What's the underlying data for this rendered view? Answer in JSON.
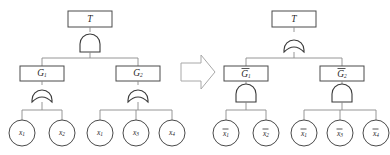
{
  "figure": {
    "background_color": "#ffffff",
    "wire_color": "#8a8a8a",
    "gate_stroke_color": "#3a3a3a",
    "box_stroke_color": "#4a4a4a",
    "arrow_stroke_color": "#a8a8a8",
    "text_color": "#2a2a2a"
  },
  "transform_arrow": {
    "name": "block-arrow-right",
    "direction": "right",
    "label": ""
  },
  "trees": [
    {
      "id": "left-tree",
      "name": "original-fault-tree",
      "root": {
        "label": "T",
        "overbar": false,
        "shape": "rectangle"
      },
      "root_gate": {
        "type": "AND",
        "name": "and-gate-top"
      },
      "intermediates": [
        {
          "label": "G",
          "subscript": "1",
          "overbar": false,
          "shape": "rectangle",
          "gate": {
            "type": "OR",
            "name": "or-gate-g1"
          },
          "leaves": [
            {
              "label": "x",
              "subscript": "1",
              "overbar": false
            },
            {
              "label": "x",
              "subscript": "2",
              "overbar": false
            }
          ]
        },
        {
          "label": "G",
          "subscript": "2",
          "overbar": false,
          "shape": "rectangle",
          "gate": {
            "type": "OR",
            "name": "or-gate-g2"
          },
          "leaves": [
            {
              "label": "x",
              "subscript": "1",
              "overbar": false
            },
            {
              "label": "x",
              "subscript": "3",
              "overbar": false
            },
            {
              "label": "x",
              "subscript": "4",
              "overbar": false
            }
          ]
        }
      ]
    },
    {
      "id": "right-tree",
      "name": "dual-fault-tree",
      "root": {
        "label": "T",
        "overbar": false,
        "shape": "rectangle"
      },
      "root_gate": {
        "type": "OR",
        "name": "or-gate-top"
      },
      "intermediates": [
        {
          "label": "G",
          "subscript": "1",
          "overbar": true,
          "shape": "rectangle",
          "gate": {
            "type": "AND",
            "name": "and-gate-g1bar"
          },
          "leaves": [
            {
              "label": "x",
              "subscript": "1",
              "overbar": true
            },
            {
              "label": "x",
              "subscript": "2",
              "overbar": true
            }
          ]
        },
        {
          "label": "G",
          "subscript": "2",
          "overbar": true,
          "shape": "rectangle",
          "gate": {
            "type": "AND",
            "name": "and-gate-g2bar"
          },
          "leaves": [
            {
              "label": "x",
              "subscript": "1",
              "overbar": true
            },
            {
              "label": "x",
              "subscript": "3",
              "overbar": true
            },
            {
              "label": "x",
              "subscript": "4",
              "overbar": true
            }
          ]
        }
      ]
    }
  ]
}
